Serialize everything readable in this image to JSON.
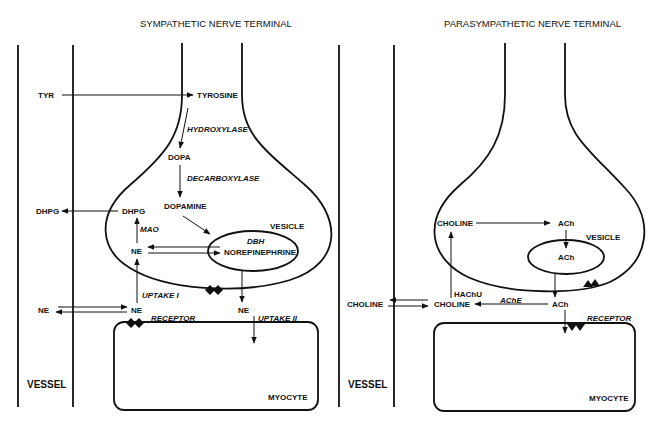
{
  "sympathetic": {
    "title": "SYMPATHETIC NERVE TERMINAL",
    "labels": {
      "tyr": "TYR",
      "tyrosine": "TYROSINE",
      "hydroxylase": "HYDROXYLASE",
      "dopa": "DOPA",
      "decarboxylase": "DECARBOXYLASE",
      "dopamine": "DOPAMINE",
      "dhpg_out": "DHPG",
      "dhpg_in": "DHPG",
      "mao": "MAO",
      "vesicle": "VESICLE",
      "dbh": "DBH",
      "norepinephrine": "NOREPINEPHRINE",
      "ne_in": "NE",
      "uptake1": "UPTAKE I",
      "ne_vessel": "NE",
      "ne_cleft": "NE",
      "ne_release": "NE",
      "receptor": "RECEPTOR",
      "uptake2": "UPTAKE II",
      "vessel": "VESSEL",
      "myocyte": "MYOCYTE"
    }
  },
  "parasympathetic": {
    "title": "PARASYMPATHETIC NERVE TERMINAL",
    "labels": {
      "choline_in": "CHOLINE",
      "ach": "ACh",
      "vesicle": "VESICLE",
      "ach_vesicle": "ACh",
      "hachu": "HAChU",
      "choline_vessel": "CHOLINE",
      "choline_cleft": "CHOLINE",
      "ache": "AChE",
      "ach_cleft": "ACh",
      "receptor": "RECEPTOR",
      "vessel": "VESSEL",
      "myocyte": "MYOCYTE"
    }
  }
}
